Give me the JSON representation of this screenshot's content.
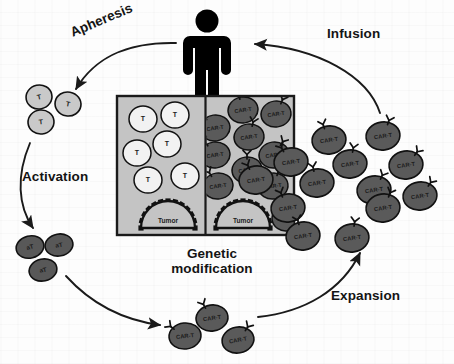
{
  "diagram": {
    "colors": {
      "tcell_fill": "#c9c9c9",
      "tcell_white_fill": "#f2f2f2",
      "activated_fill": "#585858",
      "cart_fill": "#5a5a5a",
      "box_fill": "#c4c4c4",
      "box_border": "#1a1a1a",
      "figure": "#000000",
      "arrow": "#1a1a1a",
      "text": "#141414"
    },
    "stage_labels": [
      {
        "id": "apheresis",
        "text": "Apheresis",
        "x": 68,
        "y": 33,
        "size": 13.5,
        "rotate": -23
      },
      {
        "id": "activation",
        "text": "Activation",
        "x": 22,
        "y": 169,
        "size": 13.5,
        "rotate": 0
      },
      {
        "id": "genetic-modification",
        "text": "Genetic\nmodification",
        "x": 164,
        "y": 246,
        "size": 13.5,
        "rotate": 0
      },
      {
        "id": "expansion",
        "text": "Expansion",
        "x": 331,
        "y": 288,
        "size": 13.5,
        "rotate": 0
      },
      {
        "id": "infusion",
        "text": "Infusion",
        "x": 327,
        "y": 33,
        "size": 13.5,
        "rotate": 0
      }
    ],
    "patient": {
      "name": "patient-figure",
      "x": 207,
      "y": 8
    },
    "apheresis_cells": {
      "label": "T",
      "cells": [
        {
          "cx": 39,
          "cy": 97,
          "rx": 13,
          "ry": 12,
          "rot": -12
        },
        {
          "cx": 68,
          "cy": 104,
          "rx": 13,
          "ry": 12,
          "rot": 10
        },
        {
          "cx": 41,
          "cy": 122,
          "rx": 13,
          "ry": 12,
          "rot": -6
        }
      ]
    },
    "activated_cells": {
      "label": "aT",
      "cells": [
        {
          "cx": 30,
          "cy": 247,
          "rx": 14,
          "ry": 11,
          "rot": -14
        },
        {
          "cx": 59,
          "cy": 245,
          "rx": 14,
          "ry": 11,
          "rot": -10
        },
        {
          "cx": 43,
          "cy": 270,
          "rx": 14,
          "ry": 11,
          "rot": -12
        }
      ]
    },
    "modified_cells": {
      "label": "CAR-T",
      "cells": [
        {
          "cx": 212,
          "cy": 318,
          "rx": 16,
          "ry": 13,
          "rot": -8,
          "receptors": [
            -28
          ]
        },
        {
          "cx": 185,
          "cy": 336,
          "rx": 16,
          "ry": 13,
          "rot": -6,
          "receptors": [
            -52
          ]
        },
        {
          "cx": 238,
          "cy": 340,
          "rx": 16,
          "ry": 13,
          "rot": -10,
          "receptors": [
            32
          ]
        }
      ]
    },
    "expansion_cells": {
      "label": "CAR-T",
      "cells": [
        {
          "cx": 329,
          "cy": 140,
          "rx": 17,
          "ry": 14,
          "rot": -8,
          "receptors": [
            -18
          ]
        },
        {
          "cx": 383,
          "cy": 136,
          "rx": 17,
          "ry": 14,
          "rot": -8,
          "receptors": [
            18
          ]
        },
        {
          "cx": 291,
          "cy": 162,
          "rx": 17,
          "ry": 14,
          "rot": -8,
          "receptors": [
            -30
          ]
        },
        {
          "cx": 350,
          "cy": 164,
          "rx": 17,
          "ry": 14,
          "rot": -8,
          "receptors": [
            10
          ]
        },
        {
          "cx": 406,
          "cy": 165,
          "rx": 17,
          "ry": 14,
          "rot": -8,
          "receptors": [
            36
          ]
        },
        {
          "cx": 256,
          "cy": 180,
          "rx": 17,
          "ry": 14,
          "rot": -8,
          "receptors": [
            -26
          ]
        },
        {
          "cx": 317,
          "cy": 183,
          "rx": 17,
          "ry": 14,
          "rot": -8,
          "receptors": [
            -12
          ]
        },
        {
          "cx": 374,
          "cy": 190,
          "rx": 17,
          "ry": 14,
          "rot": -8,
          "receptors": [
            26
          ]
        },
        {
          "cx": 420,
          "cy": 196,
          "rx": 17,
          "ry": 14,
          "rot": -8,
          "receptors": [
            34
          ]
        },
        {
          "cx": 288,
          "cy": 208,
          "rx": 17,
          "ry": 14,
          "rot": -8,
          "receptors": [
            -22
          ]
        },
        {
          "cx": 383,
          "cy": 208,
          "rx": 17,
          "ry": 14,
          "rot": -8,
          "receptors": [
            22
          ]
        },
        {
          "cx": 303,
          "cy": 236,
          "rx": 17,
          "ry": 14,
          "rot": -8,
          "receptors": [
            -16
          ]
        },
        {
          "cx": 352,
          "cy": 238,
          "rx": 17,
          "ry": 14,
          "rot": -8,
          "receptors": [
            8
          ]
        }
      ]
    },
    "center_box": {
      "x": 117,
      "y": 96,
      "width": 177,
      "height": 139,
      "left_panel": {
        "name": "pre-modification-panel",
        "cell_label": "T",
        "tumor_label": "Tumor",
        "cells": [
          {
            "cx": 143,
            "cy": 119,
            "rx": 14,
            "ry": 13
          },
          {
            "cx": 175,
            "cy": 115,
            "rx": 14,
            "ry": 13
          },
          {
            "cx": 167,
            "cy": 144,
            "rx": 14,
            "ry": 13
          },
          {
            "cx": 137,
            "cy": 153,
            "rx": 14,
            "ry": 13
          },
          {
            "cx": 148,
            "cy": 180,
            "rx": 14,
            "ry": 13
          },
          {
            "cx": 185,
            "cy": 176,
            "rx": 14,
            "ry": 13
          }
        ],
        "tumor": {
          "cx": 168,
          "cy": 228,
          "r": 27
        }
      },
      "right_panel": {
        "name": "post-modification-panel",
        "cell_label": "CAR-T",
        "tumor_label": "Tumor",
        "cells": [
          {
            "cx": 243,
            "cy": 110,
            "rx": 15,
            "ry": 13,
            "receptors": [
              -14
            ]
          },
          {
            "cx": 276,
            "cy": 114,
            "rx": 15,
            "ry": 13,
            "receptors": [
              22
            ]
          },
          {
            "cx": 215,
            "cy": 128,
            "rx": 15,
            "ry": 13,
            "receptors": [
              -40
            ]
          },
          {
            "cx": 249,
            "cy": 137,
            "rx": 15,
            "ry": 13,
            "receptors": [
              14
            ]
          },
          {
            "cx": 215,
            "cy": 155,
            "rx": 15,
            "ry": 13,
            "receptors": [
              -34
            ]
          },
          {
            "cx": 274,
            "cy": 155,
            "rx": 15,
            "ry": 13,
            "receptors": [
              30
            ]
          },
          {
            "cx": 247,
            "cy": 170,
            "rx": 15,
            "ry": 13,
            "receptors": [
              0
            ]
          },
          {
            "cx": 218,
            "cy": 186,
            "rx": 15,
            "ry": 13,
            "receptors": [
              -30
            ]
          },
          {
            "cx": 273,
            "cy": 186,
            "rx": 15,
            "ry": 13,
            "receptors": [
              18
            ]
          },
          {
            "cx": 286,
            "cy": 218,
            "rx": 14,
            "ry": 13,
            "receptors": [
              -18
            ]
          }
        ],
        "tumor": {
          "cx": 243,
          "cy": 228,
          "r": 27
        }
      }
    },
    "arrows": [
      {
        "name": "apheresis-arrow",
        "from": "patient",
        "to": "apheresis-cells"
      },
      {
        "name": "activation-arrow",
        "from": "apheresis-cells",
        "to": "activated-cells"
      },
      {
        "name": "genetic-modification-arrow",
        "from": "activated-cells",
        "to": "modified-cells"
      },
      {
        "name": "expansion-arrow",
        "from": "modified-cells",
        "to": "expansion-cells"
      },
      {
        "name": "infusion-arrow",
        "from": "expansion-cells",
        "to": "patient"
      }
    ]
  }
}
